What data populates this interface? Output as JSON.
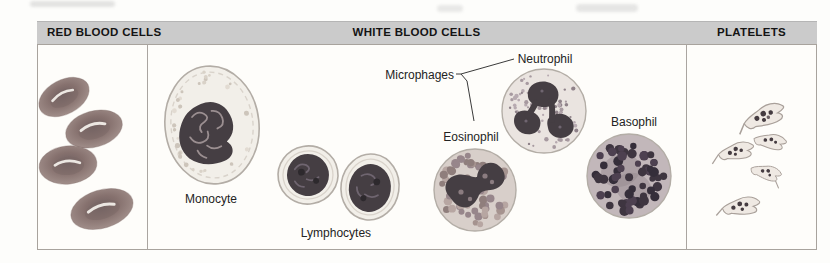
{
  "sections": [
    {
      "label": "RED BLOOD CELLS"
    },
    {
      "label": "WHITE BLOOD CELLS"
    },
    {
      "label": "PLATELETS"
    }
  ],
  "labels": {
    "monocyte": "Monocyte",
    "lymphocytes": "Lymphocytes",
    "microphages": "Microphages",
    "eosinophil": "Eosinophil",
    "neutrophil": "Neutrophil",
    "basophil": "Basophil"
  },
  "colors": {
    "header_bar": "#cbcbcb",
    "header_text": "#141414",
    "panel_border": "#a8a39d",
    "panel_bg": "#fefdfa",
    "divider": "#aaa5a0",
    "label_text": "#232323",
    "connector": "#3a3a3a",
    "smudge": "#c2c2c2",
    "rbc_dark": "#6f5f60",
    "rbc_mid": "#8a7572",
    "rbc_light": "#ab9792",
    "rbc_rim": "#b7a5a0",
    "rbc_highlight": "#f8f5ef",
    "cytoplasm_pale": "#f2efe9",
    "cell_outline": "#b3ada6",
    "inner_ring": "#d9d3cb",
    "nucleus_dark": "#453e43",
    "nucleus_darker": "#2d292d",
    "nucleus_squiggle": "#9b8f91",
    "lymph_squiggle": "#6f6570",
    "eos_cytoplasm": "#d8cfca",
    "eos_nucleus_hole": "#8b7c80",
    "neut_cytoplasm": "#eae4e0",
    "baso_cytoplasm": "#c2b7ba",
    "baso_nucleus_shadow": "#958a90",
    "platelet_fill": "#efe9e3",
    "platelet_outline": "#a9a09a",
    "platelet_dot": "#453c41",
    "platelet_dot_light": "#6d6266",
    "monocyte_speckles": [
      "#d9d2c8",
      "#cdc5bb",
      "#e2dbd2"
    ],
    "eos_granules": [
      "#a5938f",
      "#8f7e7c",
      "#b7a6a2",
      "#97868b"
    ],
    "neut_granules": [
      "#a79aa0",
      "#8f8289",
      "#b7aab0"
    ],
    "baso_granules": [
      "#3e3540",
      "#4d4050",
      "#352e3a"
    ]
  }
}
